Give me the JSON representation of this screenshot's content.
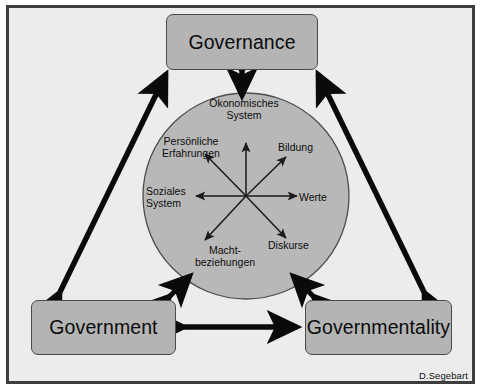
{
  "figure": {
    "credit": "D.Segebart",
    "frame_color": "#3d3d3d",
    "background_color": "#ececec",
    "box_fill_color": "#b4b4b4",
    "circle_fill_color": "#b8b8b8",
    "arrow_color": "#0a0a0a"
  },
  "nodes": {
    "governance": {
      "label": "Governance"
    },
    "government": {
      "label": "Government"
    },
    "governmentality": {
      "label": "Governmentality"
    }
  },
  "sphere": {
    "labels": {
      "oekonomisches_system": "Ökonomisches\nSystem",
      "persoenliche_erfahrungen": "Persönliche\nErfahrungen",
      "bildung": "Bildung",
      "soziales_system": "Soziales\nSystem",
      "werte": "Werte",
      "machtbeziehungen": "Macht-\nbeziehungen",
      "diskurse": "Diskurse"
    },
    "radial_arrow_count": 7,
    "radial_arrow_directions": [
      "up",
      "up-right",
      "right",
      "down-right",
      "down-left",
      "left",
      "up-left"
    ]
  },
  "connections": {
    "governance_government": "double-headed",
    "governance_governmentality": "double-headed",
    "government_governmentality": "double-headed",
    "governance_sphere": "double-headed",
    "government_sphere": "double-headed",
    "governmentality_sphere": "double-headed"
  }
}
